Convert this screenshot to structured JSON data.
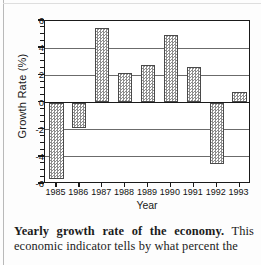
{
  "figure": {
    "ylabel": "Growth Rate (%)",
    "xlabel": "Year"
  },
  "caption": {
    "lead": "Yearly growth rate of the economy.",
    "body": " This economic indicator tells by what percent the",
    "line3": "economy has increased or decreased, whe"
  },
  "chart_data": {
    "type": "bar",
    "title": "",
    "xlabel": "Year",
    "ylabel": "Growth Rate (%)",
    "categories": [
      "1985",
      "1986",
      "1987",
      "1988",
      "1989",
      "1990",
      "1991",
      "1992",
      "1993"
    ],
    "values": [
      -5.6,
      -1.9,
      5.45,
      2.15,
      2.75,
      4.95,
      2.65,
      -4.5,
      0.8
    ],
    "ylim": [
      -6,
      6
    ],
    "ytick_labels": [
      "6",
      "4",
      "2",
      "0",
      "-2",
      "-4",
      "-6"
    ],
    "ytick_values": [
      6,
      4,
      2,
      0,
      -2,
      -4,
      -6
    ],
    "minor_tick_step": 0.5,
    "gridlines": [
      4,
      2,
      0,
      -2,
      -4
    ],
    "grid": true,
    "legend": "none",
    "bar_fill": "checkerboard-gray",
    "bar_fill_color": "#8e8e8e",
    "bar_edge_color": "#4a4a4a",
    "axis_color": "#1a1a1a"
  }
}
